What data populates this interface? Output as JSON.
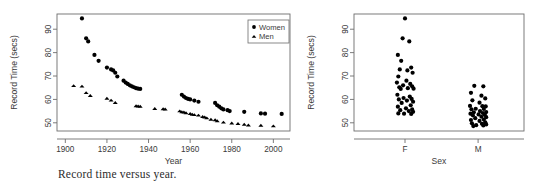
{
  "figure": {
    "panels": [
      {
        "id": "panel-year",
        "caption": "Record time versus year.",
        "chart_ref": 0
      },
      {
        "id": "panel-sex",
        "caption": "Record time versus sex.",
        "chart_ref": 1
      }
    ]
  },
  "chart_data": [
    {
      "type": "scatter",
      "title": "",
      "xlabel": "Year",
      "ylabel": "Record Time (secs)",
      "xlim": [
        1896,
        2008
      ],
      "ylim": [
        46.5,
        96.5
      ],
      "xticks": [
        1900,
        1920,
        1940,
        1960,
        1980,
        2000
      ],
      "xtick_labels": [
        "1900",
        "1920",
        "1940",
        "1960",
        "1980",
        "2000"
      ],
      "yticks": [
        50,
        60,
        70,
        80,
        90
      ],
      "ytick_labels": [
        "50",
        "60",
        "70",
        "80",
        "90"
      ],
      "grid": false,
      "legend_position": "top-right",
      "legend": [
        {
          "label": "Women",
          "marker": "circle"
        },
        {
          "label": "Men",
          "marker": "triangle"
        }
      ],
      "series": [
        {
          "name": "Women",
          "marker": "circle",
          "points": [
            [
              1908,
              94.6
            ],
            [
              1910,
              86.1
            ],
            [
              1911,
              84.8
            ],
            [
              1914,
              79.0
            ],
            [
              1916,
              76.5
            ],
            [
              1920,
              73.6
            ],
            [
              1922,
              72.8
            ],
            [
              1923,
              72.4
            ],
            [
              1924,
              71.4
            ],
            [
              1925,
              69.8
            ],
            [
              1928,
              68.0
            ],
            [
              1929,
              67.2
            ],
            [
              1930,
              66.6
            ],
            [
              1931,
              66.0
            ],
            [
              1932,
              65.6
            ],
            [
              1933,
              65.2
            ],
            [
              1934,
              64.8
            ],
            [
              1935,
              64.6
            ],
            [
              1936,
              64.5
            ],
            [
              1956,
              62.0
            ],
            [
              1957,
              61.2
            ],
            [
              1958,
              60.6
            ],
            [
              1959,
              60.2
            ],
            [
              1960,
              60.0
            ],
            [
              1962,
              59.5
            ],
            [
              1964,
              59.0
            ],
            [
              1972,
              58.5
            ],
            [
              1973,
              57.5
            ],
            [
              1974,
              56.9
            ],
            [
              1975,
              56.2
            ],
            [
              1976,
              55.7
            ],
            [
              1978,
              55.4
            ],
            [
              1979,
              55.0
            ],
            [
              1986,
              54.7
            ],
            [
              1994,
              54.0
            ],
            [
              1996,
              53.9
            ],
            [
              2004,
              53.8
            ]
          ]
        },
        {
          "name": "Men",
          "marker": "triangle",
          "points": [
            [
              1904,
              65.8
            ],
            [
              1908,
              65.6
            ],
            [
              1910,
              62.8
            ],
            [
              1912,
              61.6
            ],
            [
              1920,
              60.4
            ],
            [
              1922,
              59.6
            ],
            [
              1924,
              58.6
            ],
            [
              1934,
              57.2
            ],
            [
              1935,
              57.1
            ],
            [
              1936,
              57.0
            ],
            [
              1943,
              56.0
            ],
            [
              1947,
              55.9
            ],
            [
              1948,
              55.8
            ],
            [
              1955,
              55.0
            ],
            [
              1956,
              54.6
            ],
            [
              1957,
              54.5
            ],
            [
              1958,
              54.2
            ],
            [
              1960,
              53.9
            ],
            [
              1961,
              53.6
            ],
            [
              1962,
              53.4
            ],
            [
              1964,
              53.2
            ],
            [
              1966,
              52.6
            ],
            [
              1967,
              52.4
            ],
            [
              1968,
              52.0
            ],
            [
              1970,
              51.4
            ],
            [
              1972,
              51.2
            ],
            [
              1973,
              50.8
            ],
            [
              1976,
              50.2
            ],
            [
              1980,
              49.8
            ],
            [
              1983,
              49.6
            ],
            [
              1986,
              49.3
            ],
            [
              1988,
              49.0
            ],
            [
              1994,
              48.9
            ],
            [
              2000,
              48.6
            ]
          ]
        }
      ]
    },
    {
      "type": "scatter",
      "title": "",
      "xlabel": "Sex",
      "ylabel": "Record Time (secs)",
      "ylim": [
        46.5,
        96.5
      ],
      "yticks": [
        50,
        60,
        70,
        80,
        90
      ],
      "ytick_labels": [
        "50",
        "60",
        "70",
        "80",
        "90"
      ],
      "xtick_labels": [
        "F",
        "M"
      ],
      "categories": [
        "F",
        "M"
      ],
      "grid": false,
      "legend_position": "none",
      "groups": [
        {
          "name": "F",
          "values": [
            94.6,
            86.1,
            84.8,
            79.0,
            76.5,
            73.6,
            72.8,
            72.4,
            71.4,
            69.8,
            68.0,
            67.2,
            66.6,
            66.0,
            65.6,
            65.2,
            64.8,
            64.6,
            64.5,
            62.0,
            61.2,
            60.6,
            60.2,
            60.0,
            59.5,
            59.0,
            58.5,
            57.5,
            56.9,
            56.2,
            55.7,
            55.4,
            55.0,
            54.7,
            54.0,
            53.9,
            53.8
          ],
          "jitter": [
            0.0,
            -0.1,
            0.18,
            -0.3,
            -0.16,
            0.26,
            -0.22,
            0.1,
            0.32,
            -0.28,
            0.06,
            -0.34,
            0.22,
            -0.08,
            0.3,
            -0.24,
            0.12,
            0.36,
            -0.18,
            -0.32,
            0.2,
            -0.06,
            0.28,
            -0.26,
            0.08,
            0.34,
            -0.14,
            0.24,
            -0.3,
            0.04,
            0.3,
            -0.2,
            0.16,
            0.34,
            -0.28,
            -0.04,
            0.26
          ]
        },
        {
          "name": "M",
          "values": [
            65.8,
            65.6,
            62.8,
            61.6,
            60.4,
            59.6,
            58.6,
            57.2,
            57.1,
            57.0,
            56.0,
            55.9,
            55.8,
            55.0,
            54.6,
            54.5,
            54.2,
            53.9,
            53.6,
            53.4,
            53.2,
            52.6,
            52.4,
            52.0,
            51.4,
            51.2,
            50.8,
            50.2,
            49.8,
            49.6,
            49.3,
            49.0,
            48.9,
            48.6
          ],
          "jitter": [
            -0.16,
            0.22,
            -0.3,
            0.14,
            0.3,
            -0.24,
            0.06,
            -0.34,
            0.18,
            0.32,
            -0.1,
            0.24,
            -0.28,
            0.08,
            0.34,
            -0.18,
            0.2,
            -0.32,
            0.02,
            0.28,
            -0.22,
            0.14,
            0.34,
            -0.12,
            0.24,
            -0.3,
            0.06,
            0.3,
            -0.26,
            0.16,
            0.34,
            -0.08,
            0.22,
            -0.2
          ]
        }
      ]
    }
  ]
}
